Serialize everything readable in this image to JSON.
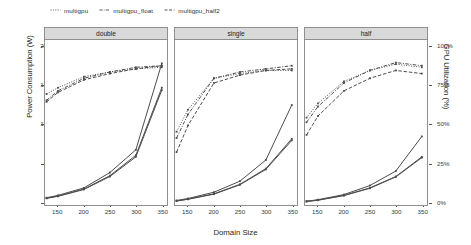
{
  "legend": {
    "items": [
      {
        "label": "multigpu",
        "key": "dotted-line-key"
      },
      {
        "label": "multigpu_float",
        "key": "dashdot-line-key"
      },
      {
        "label": "multigpu_half2",
        "key": "dashed-line-key"
      }
    ]
  },
  "axes": {
    "xlabel": "Domain Size",
    "ylabel_left": "Power Consumption (W)",
    "ylabel_right": "GPU Utilization (%)",
    "yticks_left": [
      "0",
      "500",
      "1000",
      "1500",
      "2000"
    ],
    "yticks_right": [
      "0%",
      "25%",
      "50%",
      "75%",
      "100%"
    ],
    "xticks": [
      "150",
      "200",
      "250",
      "300",
      "350"
    ]
  },
  "panels": [
    {
      "title": "double"
    },
    {
      "title": "single"
    },
    {
      "title": "half"
    }
  ],
  "colors": {
    "strip_fill": "#d9d9d9",
    "panel_border": "#8f8f8f",
    "line": "#4d4d4d",
    "background": "#ffffff"
  },
  "chart_data": {
    "type": "line",
    "title": "",
    "xlabel": "Domain Size",
    "ylabel": "Power Consumption (W)",
    "ylabel_secondary": "GPU Utilization (%)",
    "xlim": [
      125,
      360
    ],
    "ylim": [
      0,
      2100
    ],
    "ylim_secondary": [
      0,
      105
    ],
    "xticks": [
      150,
      200,
      250,
      300,
      350
    ],
    "yticks": [
      0,
      500,
      1000,
      1500,
      2000
    ],
    "yticks_secondary": [
      0,
      25,
      50,
      75,
      100
    ],
    "grid": false,
    "legend_position": "top-left",
    "facets": [
      "double",
      "single",
      "half"
    ],
    "x": [
      128,
      150,
      200,
      250,
      300,
      350
    ],
    "panels": [
      {
        "facet": "double",
        "power_series": [
          {
            "name": "multigpu",
            "axis": "left",
            "style": "solid",
            "values": [
              80,
              110,
              205,
              400,
              690,
              1790
            ]
          },
          {
            "name": "multigpu_float",
            "axis": "left",
            "style": "solid",
            "values": [
              75,
              100,
              190,
              360,
              620,
              1480
            ]
          },
          {
            "name": "multigpu_half2",
            "axis": "left",
            "style": "solid",
            "values": [
              72,
              98,
              185,
              350,
              600,
              1450
            ]
          }
        ],
        "util_series": [
          {
            "name": "multigpu",
            "axis": "right",
            "style": "dotted",
            "values": [
              70,
              74,
              81,
              84,
              86,
              87
            ]
          },
          {
            "name": "multigpu_float",
            "axis": "right",
            "style": "dashdot",
            "values": [
              66,
              72,
              80,
              84,
              87,
              88
            ]
          },
          {
            "name": "multigpu_half2",
            "axis": "right",
            "style": "dashed",
            "values": [
              65,
              71,
              79,
              83,
              86,
              88
            ]
          }
        ]
      },
      {
        "facet": "single",
        "power_series": [
          {
            "name": "multigpu",
            "axis": "left",
            "style": "solid",
            "values": [
              45,
              70,
              150,
              290,
              560,
              1260
            ]
          },
          {
            "name": "multigpu_float",
            "axis": "left",
            "style": "solid",
            "values": [
              40,
              62,
              130,
              250,
              450,
              830
            ]
          },
          {
            "name": "multigpu_half2",
            "axis": "left",
            "style": "solid",
            "values": [
              38,
              60,
              125,
              245,
              440,
              810
            ]
          }
        ],
        "util_series": [
          {
            "name": "multigpu",
            "axis": "right",
            "style": "dotted",
            "values": [
              46,
              60,
              80,
              83,
              85,
              85
            ]
          },
          {
            "name": "multigpu_float",
            "axis": "right",
            "style": "dashdot",
            "values": [
              42,
              57,
              80,
              84,
              86,
              88
            ]
          },
          {
            "name": "multigpu_half2",
            "axis": "right",
            "style": "dashed",
            "values": [
              33,
              50,
              77,
              82,
              85,
              86
            ]
          }
        ]
      },
      {
        "facet": "half",
        "power_series": [
          {
            "name": "multigpu",
            "axis": "left",
            "style": "solid",
            "values": [
              35,
              55,
              120,
              235,
              420,
              860
            ]
          },
          {
            "name": "multigpu_float",
            "axis": "left",
            "style": "solid",
            "values": [
              33,
              50,
              110,
              205,
              350,
              600
            ]
          },
          {
            "name": "multigpu_half2",
            "axis": "left",
            "style": "solid",
            "values": [
              32,
              48,
              107,
              200,
              345,
              590
            ]
          }
        ],
        "util_series": [
          {
            "name": "multigpu",
            "axis": "right",
            "style": "dotted",
            "values": [
              55,
              64,
              78,
              85,
              89,
              87
            ]
          },
          {
            "name": "multigpu_float",
            "axis": "right",
            "style": "dashdot",
            "values": [
              52,
              62,
              77,
              85,
              90,
              88
            ]
          },
          {
            "name": "multigpu_half2",
            "axis": "right",
            "style": "dashed",
            "values": [
              44,
              56,
              72,
              80,
              85,
              83
            ]
          }
        ]
      }
    ]
  }
}
